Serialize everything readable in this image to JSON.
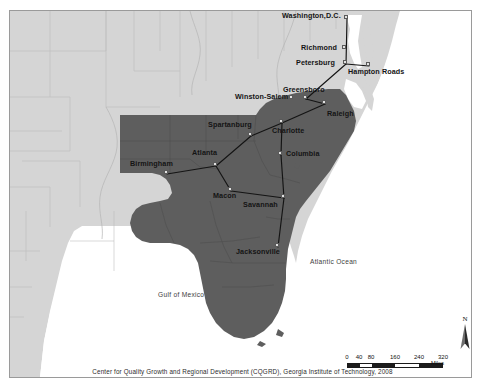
{
  "figure": {
    "footer_credit": "Center for Quality Growth and Regional Development (CQGRD), Georgia Institute of Technology, 2008"
  },
  "colors": {
    "background_land": "#d5d5d5",
    "study_region": "#5e5e5e",
    "water": "#ffffff",
    "county_line": "#bdbdbd",
    "corridor_line": "#1a1a1a",
    "node_fill": "#e2e2e2",
    "node_stroke": "#5a5a5a",
    "frame": "#9a9a9a",
    "label_text": "#141414"
  },
  "cities": [
    {
      "name": "Washington,D.C.",
      "x": 346,
      "y": 17,
      "label_x": 282,
      "label_y": 12,
      "label_align": "left"
    },
    {
      "name": "Richmond",
      "x": 344,
      "y": 47,
      "label_x": 301,
      "label_y": 44,
      "label_align": "left"
    },
    {
      "name": "Petersburg",
      "x": 345,
      "y": 62,
      "label_x": 296,
      "label_y": 59,
      "label_align": "left"
    },
    {
      "name": "Hampton Roads",
      "x": 368,
      "y": 64,
      "label_x": 348,
      "label_y": 68,
      "label_align": "left"
    },
    {
      "name": "Greensboro",
      "x": 305,
      "y": 97,
      "label_x": 283,
      "label_y": 86,
      "label_align": "left"
    },
    {
      "name": "Winston-Salem",
      "x": 291,
      "y": 97,
      "label_x": 235,
      "label_y": 93,
      "label_align": "left"
    },
    {
      "name": "Raleigh",
      "x": 324,
      "y": 102,
      "label_x": 327,
      "label_y": 110,
      "label_align": "left"
    },
    {
      "name": "Charlotte",
      "x": 281,
      "y": 121,
      "label_x": 272,
      "label_y": 127,
      "label_align": "left"
    },
    {
      "name": "Spartanburg",
      "x": 250,
      "y": 134,
      "label_x": 208,
      "label_y": 121,
      "label_align": "left"
    },
    {
      "name": "Columbia",
      "x": 280,
      "y": 153,
      "label_x": 286,
      "label_y": 150,
      "label_align": "left"
    },
    {
      "name": "Atlanta",
      "x": 215,
      "y": 164,
      "label_x": 192,
      "label_y": 149,
      "label_align": "left"
    },
    {
      "name": "Birmingham",
      "x": 166,
      "y": 172,
      "label_x": 130,
      "label_y": 160,
      "label_align": "left"
    },
    {
      "name": "Macon",
      "x": 230,
      "y": 189,
      "label_x": 213,
      "label_y": 192,
      "label_align": "left"
    },
    {
      "name": "Savannah",
      "x": 283,
      "y": 196,
      "label_x": 243,
      "label_y": 201,
      "label_align": "left"
    },
    {
      "name": "Jacksonville",
      "x": 277,
      "y": 245,
      "label_x": 236,
      "label_y": 248,
      "label_align": "left"
    }
  ],
  "corridors": [
    {
      "from": "Washington,D.C.",
      "to": "Petersburg"
    },
    {
      "from": "Petersburg",
      "to": "Hampton Roads"
    },
    {
      "from": "Petersburg",
      "to": "Greensboro"
    },
    {
      "from": "Greensboro",
      "to": "Raleigh"
    },
    {
      "from": "Raleigh",
      "to": "Charlotte"
    },
    {
      "from": "Charlotte",
      "to": "Spartanburg"
    },
    {
      "from": "Charlotte",
      "to": "Columbia"
    },
    {
      "from": "Spartanburg",
      "to": "Atlanta"
    },
    {
      "from": "Atlanta",
      "to": "Birmingham"
    },
    {
      "from": "Atlanta",
      "to": "Macon"
    },
    {
      "from": "Macon",
      "to": "Savannah"
    },
    {
      "from": "Columbia",
      "to": "Savannah"
    },
    {
      "from": "Savannah",
      "to": "Jacksonville"
    }
  ],
  "water_labels": [
    {
      "name": "Atlantic Ocean",
      "x": 310,
      "y": 258
    },
    {
      "name": "Gulf of Mexico",
      "x": 158,
      "y": 291
    }
  ],
  "scale_bar": {
    "ticks": [
      "0",
      "40",
      "80",
      "160",
      "240",
      "320"
    ],
    "unit": "Miles"
  },
  "compass": {
    "label": "N",
    "icon": "north-arrow-icon"
  }
}
